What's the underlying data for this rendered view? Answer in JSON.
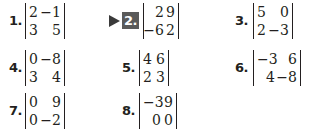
{
  "exercise_set": {
    "problems": [
      {
        "number": "1.",
        "highlighted": false,
        "matrix": [
          [
            "2",
            "−1"
          ],
          [
            "3",
            "5"
          ]
        ]
      },
      {
        "number": "2.",
        "highlighted": true,
        "matrix": [
          [
            "2",
            "9"
          ],
          [
            "−6",
            "2"
          ]
        ]
      },
      {
        "number": "3.",
        "highlighted": false,
        "matrix": [
          [
            "5",
            "0"
          ],
          [
            "2",
            "−3"
          ]
        ]
      },
      {
        "number": "4.",
        "highlighted": false,
        "matrix": [
          [
            "0",
            "−8"
          ],
          [
            "3",
            "4"
          ]
        ]
      },
      {
        "number": "5.",
        "highlighted": false,
        "matrix": [
          [
            "4",
            "6"
          ],
          [
            "2",
            "3"
          ]
        ]
      },
      {
        "number": "6.",
        "highlighted": false,
        "matrix": [
          [
            "−3",
            "6"
          ],
          [
            "4",
            "−8"
          ]
        ]
      },
      {
        "number": "7.",
        "highlighted": false,
        "matrix": [
          [
            "0",
            "9"
          ],
          [
            "0",
            "−2"
          ]
        ]
      },
      {
        "number": "8.",
        "highlighted": false,
        "matrix": [
          [
            "−3",
            "9"
          ],
          [
            "0",
            "0"
          ]
        ]
      }
    ]
  },
  "colors": {
    "text": "#231f20",
    "highlight_bg": "#5a5a5a",
    "highlight_text": "#ffffff",
    "pointer": "#3a3a3a"
  }
}
